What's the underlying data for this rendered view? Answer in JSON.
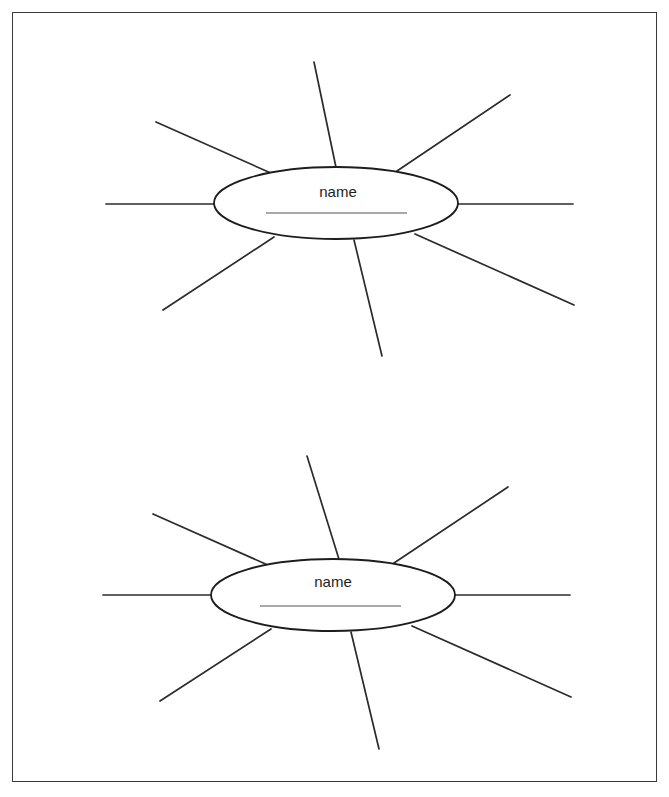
{
  "worksheet": {
    "title": "Blank Cluster / Word Web Worksheet",
    "frame": {
      "x": 12,
      "y": 12,
      "width": 645,
      "height": 770,
      "border_color": "#3a3a3a"
    },
    "background_color": "#ffffff",
    "ink_color": "#2b2b2b",
    "writing_line_color": "#8c8c8c",
    "diagram_count": 2
  },
  "diagrams": [
    {
      "id": "cluster-diagram-1",
      "label": "name",
      "writing_line_hint": "",
      "center": {
        "x": 335,
        "y": 202
      },
      "ellipse": {
        "cx": 335,
        "cy": 202,
        "rx": 122,
        "ry": 36
      },
      "label_position": {
        "x": 337,
        "y": 196
      },
      "writing_line": {
        "x1": 265,
        "y1": 212,
        "x2": 406,
        "y2": 212
      },
      "ray_count": 8,
      "rays": [
        {
          "name": "ray-top",
          "x1": 337,
          "y1": 176,
          "x2": 313,
          "y2": 61
        },
        {
          "name": "ray-upper-right",
          "x1": 396,
          "y1": 170,
          "x2": 509,
          "y2": 94
        },
        {
          "name": "ray-right",
          "x1": 457,
          "y1": 203,
          "x2": 572,
          "y2": 203
        },
        {
          "name": "ray-lower-right",
          "x1": 414,
          "y1": 233,
          "x2": 573,
          "y2": 304
        },
        {
          "name": "ray-bottom",
          "x1": 353,
          "y1": 239,
          "x2": 381,
          "y2": 355
        },
        {
          "name": "ray-lower-left",
          "x1": 273,
          "y1": 236,
          "x2": 162,
          "y2": 309
        },
        {
          "name": "ray-left",
          "x1": 213,
          "y1": 203,
          "x2": 105,
          "y2": 203
        },
        {
          "name": "ray-upper-left",
          "x1": 272,
          "y1": 173,
          "x2": 155,
          "y2": 121
        }
      ]
    },
    {
      "id": "cluster-diagram-2",
      "label": "name",
      "writing_line_hint": "",
      "center": {
        "x": 332,
        "y": 594
      },
      "ellipse": {
        "cx": 332,
        "cy": 594,
        "rx": 122,
        "ry": 36
      },
      "label_position": {
        "x": 332,
        "y": 586
      },
      "writing_line": {
        "x1": 259,
        "y1": 605,
        "x2": 400,
        "y2": 605
      },
      "ray_count": 8,
      "rays": [
        {
          "name": "ray-top",
          "x1": 341,
          "y1": 568,
          "x2": 306,
          "y2": 455
        },
        {
          "name": "ray-upper-right",
          "x1": 393,
          "y1": 562,
          "x2": 507,
          "y2": 486
        },
        {
          "name": "ray-right",
          "x1": 454,
          "y1": 594,
          "x2": 569,
          "y2": 594
        },
        {
          "name": "ray-lower-right",
          "x1": 411,
          "y1": 625,
          "x2": 570,
          "y2": 696
        },
        {
          "name": "ray-bottom",
          "x1": 350,
          "y1": 631,
          "x2": 378,
          "y2": 748
        },
        {
          "name": "ray-lower-left",
          "x1": 270,
          "y1": 628,
          "x2": 159,
          "y2": 700
        },
        {
          "name": "ray-left",
          "x1": 210,
          "y1": 594,
          "x2": 102,
          "y2": 594
        },
        {
          "name": "ray-upper-left",
          "x1": 269,
          "y1": 565,
          "x2": 152,
          "y2": 513
        }
      ]
    }
  ]
}
